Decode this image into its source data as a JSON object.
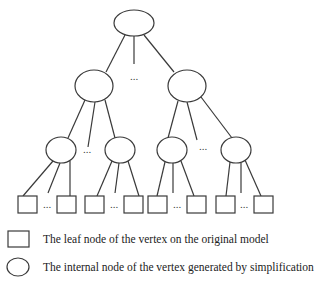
{
  "diagram": {
    "type": "tree",
    "root": {
      "id": "root",
      "shape": "ellipse",
      "cx": 134,
      "cy": 23,
      "rx": 20,
      "ry": 13
    },
    "internal_level_1": [
      {
        "id": "n1",
        "shape": "ellipse",
        "cx": 94,
        "cy": 86,
        "rx": 19,
        "ry": 16
      },
      {
        "id": "n2",
        "shape": "ellipse",
        "cx": 187,
        "cy": 86,
        "rx": 19,
        "ry": 16
      }
    ],
    "internal_level_2": [
      {
        "id": "n11",
        "parent": "n1",
        "shape": "ellipse",
        "cx": 61,
        "cy": 150,
        "rx": 15,
        "ry": 13
      },
      {
        "id": "n12",
        "parent": "n1",
        "shape": "ellipse",
        "cx": 120,
        "cy": 150,
        "rx": 15,
        "ry": 13
      },
      {
        "id": "n21",
        "parent": "n2",
        "shape": "ellipse",
        "cx": 172,
        "cy": 150,
        "rx": 15,
        "ry": 13
      },
      {
        "id": "n22",
        "parent": "n2",
        "shape": "ellipse",
        "cx": 236,
        "cy": 150,
        "rx": 15,
        "ry": 13
      }
    ],
    "leaves": [
      {
        "id": "l1",
        "parent": "n11",
        "x": 18,
        "y": 196,
        "w": 19,
        "h": 17
      },
      {
        "id": "l2",
        "parent": "n11",
        "x": 57,
        "y": 196,
        "w": 19,
        "h": 17
      },
      {
        "id": "l3",
        "parent": "n12",
        "x": 85,
        "y": 196,
        "w": 19,
        "h": 17
      },
      {
        "id": "l4",
        "parent": "n12",
        "x": 124,
        "y": 196,
        "w": 19,
        "h": 17
      },
      {
        "id": "l5",
        "parent": "n21",
        "x": 148,
        "y": 196,
        "w": 19,
        "h": 17
      },
      {
        "id": "l6",
        "parent": "n21",
        "x": 187,
        "y": 196,
        "w": 19,
        "h": 17
      },
      {
        "id": "l7",
        "parent": "n22",
        "x": 216,
        "y": 196,
        "w": 19,
        "h": 17
      },
      {
        "id": "l8",
        "parent": "n22",
        "x": 254,
        "y": 196,
        "w": 19,
        "h": 17
      }
    ],
    "ellipsis_symbol": "...",
    "ellipsis_positions": [
      {
        "x": 134,
        "y": 80
      },
      {
        "x": 87,
        "y": 153
      },
      {
        "x": 203,
        "y": 150
      },
      {
        "x": 47,
        "y": 208
      },
      {
        "x": 114,
        "y": 208
      },
      {
        "x": 177,
        "y": 208
      },
      {
        "x": 244,
        "y": 208
      }
    ]
  },
  "legend": {
    "items": [
      {
        "symbol": "square",
        "label": "The leaf node of the vertex on the original model"
      },
      {
        "symbol": "circle",
        "label": "The internal node of the vertex generated by simplification"
      }
    ]
  }
}
